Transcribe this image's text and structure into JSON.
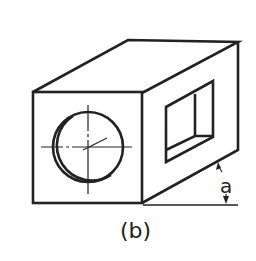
{
  "figure": {
    "caption": "(b)",
    "angle_label": "a",
    "line_color": "#222222",
    "background": "#ffffff"
  }
}
